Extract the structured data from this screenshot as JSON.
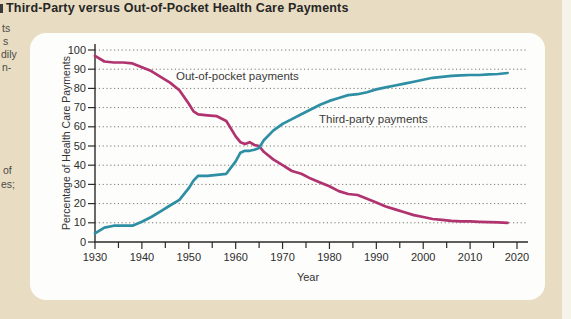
{
  "page": {
    "title": "Third-Party versus Out-of-Pocket Health Care Payments",
    "cropped_margin_fragments": [
      "ts",
      "s",
      "dily",
      "n-",
      "of",
      "es;"
    ]
  },
  "colors": {
    "page_background": "#e8dcc2",
    "card_background": "#fdfdfb",
    "out_of_pocket_line": "#b0336f",
    "third_party_line": "#2e8ea4",
    "gridline": "#6b6b60",
    "axis": "#2b2b2b"
  },
  "chart_data": {
    "type": "line",
    "title": "Third-Party versus Out-of-Pocket Health Care Payments",
    "xlabel": "Year",
    "ylabel": "Percentage of Health Care Payments",
    "xlim": [
      1930,
      2022
    ],
    "ylim": [
      0,
      100
    ],
    "x_ticks_major": [
      1930,
      1940,
      1950,
      1960,
      1970,
      1980,
      1990,
      2000,
      2010,
      2020
    ],
    "x_tick_minor_step": 5,
    "y_ticks": [
      0,
      10,
      20,
      30,
      40,
      50,
      60,
      70,
      80,
      90,
      100
    ],
    "grid": "horizontal-dotted",
    "legend_position": "inline-labels",
    "series": [
      {
        "name": "Out-of-pocket payments",
        "color": "#b0336f",
        "x": [
          1930,
          1932,
          1934,
          1936,
          1938,
          1940,
          1942,
          1944,
          1946,
          1948,
          1950,
          1951,
          1952,
          1954,
          1956,
          1958,
          1960,
          1961,
          1962,
          1963,
          1964,
          1965,
          1966,
          1968,
          1970,
          1972,
          1974,
          1976,
          1978,
          1980,
          1982,
          1984,
          1986,
          1988,
          1990,
          1992,
          1994,
          1996,
          1998,
          2000,
          2002,
          2004,
          2006,
          2008,
          2010,
          2012,
          2014,
          2016,
          2018
        ],
        "y": [
          97,
          94,
          93.5,
          93.5,
          93,
          91,
          89,
          86,
          83,
          79,
          72,
          68,
          66.5,
          66,
          65.5,
          63,
          55,
          52,
          51,
          52,
          50.5,
          50,
          47,
          43,
          40,
          37,
          35.5,
          33,
          31,
          29,
          26.5,
          25,
          24.5,
          22.5,
          20.5,
          18.5,
          17,
          15.5,
          14,
          13,
          12,
          11.5,
          11,
          10.8,
          10.8,
          10.5,
          10.3,
          10.2,
          10
        ]
      },
      {
        "name": "Third-party payments",
        "color": "#2e8ea4",
        "x": [
          1930,
          1932,
          1934,
          1936,
          1938,
          1940,
          1942,
          1944,
          1946,
          1948,
          1950,
          1951,
          1952,
          1954,
          1956,
          1958,
          1960,
          1961,
          1962,
          1963,
          1964,
          1965,
          1966,
          1968,
          1970,
          1972,
          1974,
          1976,
          1978,
          1980,
          1982,
          1984,
          1986,
          1988,
          1990,
          1992,
          1994,
          1996,
          1998,
          2000,
          2002,
          2004,
          2006,
          2008,
          2010,
          2012,
          2014,
          2016,
          2018
        ],
        "y": [
          4.5,
          7.5,
          8.5,
          8.5,
          8.5,
          10.5,
          13,
          16,
          19,
          22,
          28,
          32,
          34.5,
          34.5,
          35,
          35.5,
          42,
          46.5,
          47.5,
          47.5,
          48,
          49,
          53,
          58,
          61.5,
          64,
          66.5,
          69,
          71.5,
          73.5,
          75,
          76.5,
          77,
          78,
          79.5,
          80.5,
          81.5,
          82.5,
          83.5,
          84.5,
          85.5,
          86,
          86.5,
          86.8,
          87,
          87,
          87.3,
          87.5,
          88
        ]
      }
    ]
  }
}
